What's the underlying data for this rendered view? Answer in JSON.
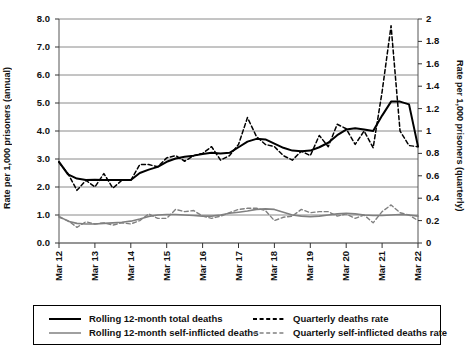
{
  "chart_data": {
    "type": "line",
    "title": "",
    "xlabel": "",
    "ylabel": "Rate per 1,000 prisoners (annual)",
    "y2label": "Rate per 1,000 prisoners (quarterly)",
    "grid": true,
    "legend_position": "bottom",
    "ylim": [
      0.0,
      8.0
    ],
    "y2lim": [
      0,
      2
    ],
    "ytick_labels": [
      "0.0",
      "1.0",
      "2.0",
      "3.0",
      "4.0",
      "5.0",
      "6.0",
      "7.0",
      "8.0"
    ],
    "ytick_values": [
      0.0,
      1.0,
      2.0,
      3.0,
      4.0,
      5.0,
      6.0,
      7.0,
      8.0
    ],
    "y2tick_labels": [
      "0",
      "0.2",
      "0.4",
      "0.6",
      "0.8",
      "1",
      "1.2",
      "1.4",
      "1.6",
      "1.8",
      "2"
    ],
    "y2tick_values": [
      0,
      0.2,
      0.4,
      0.6,
      0.8,
      1.0,
      1.2,
      1.4,
      1.6,
      1.8,
      2.0
    ],
    "xtick_labels": [
      "Mar 12",
      "Mar 13",
      "Mar 14",
      "Mar 15",
      "Mar 16",
      "Mar 17",
      "Mar 18",
      "Mar 19",
      "Mar 20",
      "Mar 21",
      "Mar 22"
    ],
    "x_index": [
      0,
      1,
      2,
      3,
      4,
      5,
      6,
      7,
      8,
      9,
      10,
      11,
      12,
      13,
      14,
      15,
      16,
      17,
      18,
      19,
      20,
      21,
      22,
      23,
      24,
      25,
      26,
      27,
      28,
      29,
      30,
      31,
      32,
      33,
      34,
      35,
      36,
      37,
      38,
      39,
      40
    ],
    "series": [
      {
        "name": "Rolling 12-month total deaths",
        "axis": "left",
        "style": "solid",
        "color": "#000000",
        "width": 2,
        "values": [
          2.9,
          2.45,
          2.3,
          2.25,
          2.26,
          2.25,
          2.25,
          2.25,
          2.25,
          2.5,
          2.62,
          2.72,
          2.9,
          3.02,
          3.08,
          3.12,
          3.18,
          3.22,
          3.2,
          3.22,
          3.42,
          3.62,
          3.72,
          3.7,
          3.55,
          3.4,
          3.3,
          3.28,
          3.3,
          3.42,
          3.58,
          3.85,
          4.05,
          4.1,
          4.05,
          4.0,
          4.55,
          5.05,
          5.05,
          4.95,
          3.45
        ]
      },
      {
        "name": "Rolling 12-month self-inflicted deaths",
        "axis": "left",
        "style": "solid",
        "color": "#808080",
        "width": 1.6,
        "values": [
          0.95,
          0.78,
          0.7,
          0.68,
          0.68,
          0.7,
          0.72,
          0.74,
          0.78,
          0.86,
          0.95,
          1.0,
          1.02,
          1.02,
          1.0,
          0.98,
          0.96,
          0.96,
          1.0,
          1.06,
          1.1,
          1.14,
          1.2,
          1.22,
          1.2,
          1.1,
          1.0,
          0.96,
          0.94,
          0.96,
          1.0,
          1.04,
          1.06,
          1.04,
          1.0,
          0.98,
          0.98,
          1.0,
          1.02,
          1.0,
          0.96
        ]
      },
      {
        "name": "Quarterly deaths rate",
        "axis": "right",
        "style": "dashed",
        "color": "#000000",
        "width": 1.5,
        "values": [
          0.72,
          0.62,
          0.47,
          0.56,
          0.5,
          0.62,
          0.49,
          0.56,
          0.56,
          0.7,
          0.7,
          0.68,
          0.76,
          0.78,
          0.73,
          0.78,
          0.8,
          0.86,
          0.74,
          0.78,
          0.88,
          1.12,
          0.95,
          0.88,
          0.86,
          0.78,
          0.74,
          0.82,
          0.78,
          0.96,
          0.86,
          1.06,
          1.02,
          0.88,
          1.0,
          0.85,
          1.35,
          1.94,
          1.0,
          0.87,
          0.86
        ]
      },
      {
        "name": "Quarterly self-inflicted deaths rate",
        "axis": "right",
        "style": "dashed",
        "color": "#808080",
        "width": 1.4,
        "values": [
          0.23,
          0.2,
          0.14,
          0.19,
          0.17,
          0.18,
          0.16,
          0.18,
          0.17,
          0.2,
          0.26,
          0.22,
          0.22,
          0.3,
          0.28,
          0.29,
          0.24,
          0.22,
          0.24,
          0.27,
          0.3,
          0.31,
          0.31,
          0.29,
          0.2,
          0.23,
          0.24,
          0.3,
          0.27,
          0.28,
          0.28,
          0.24,
          0.26,
          0.22,
          0.25,
          0.18,
          0.28,
          0.34,
          0.27,
          0.25,
          0.2
        ]
      }
    ]
  },
  "legend": {
    "items": [
      {
        "label": "Rolling 12-month total deaths",
        "style": "solid",
        "color": "#000000"
      },
      {
        "label": "Rolling 12-month self-inflicted deaths",
        "style": "solid",
        "color": "#808080"
      },
      {
        "label": "Quarterly deaths rate",
        "style": "dashed",
        "color": "#000000"
      },
      {
        "label": "Quarterly self-inflicted deaths rate",
        "style": "dashed",
        "color": "#808080"
      }
    ]
  }
}
